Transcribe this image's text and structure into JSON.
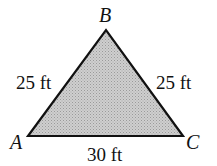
{
  "figure": {
    "type": "triangle",
    "fill": "#c8c8c8",
    "stroke": "#111111",
    "vertices": [
      {
        "name": "A",
        "x": 28,
        "y": 136
      },
      {
        "name": "B",
        "x": 106,
        "y": 30
      },
      {
        "name": "C",
        "x": 183,
        "y": 136
      }
    ],
    "labels": {
      "A": "A",
      "B": "B",
      "C": "C",
      "side_AB": "25 ft",
      "side_BC": "25 ft",
      "side_AC": "30 ft"
    }
  }
}
